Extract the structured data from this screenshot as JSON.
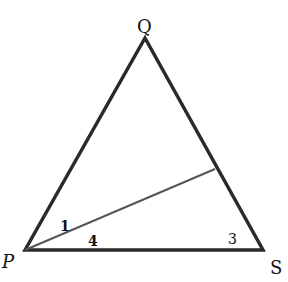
{
  "diagram": {
    "type": "geometry-triangle",
    "vertices": {
      "P": {
        "label": "P",
        "x": 25,
        "y": 250
      },
      "Q": {
        "label": "Q",
        "x": 145,
        "y": 38
      },
      "S": {
        "label": "S",
        "x": 263,
        "y": 250
      }
    },
    "cevian": {
      "from": "P",
      "to_point_on": "QS",
      "end_x": 215,
      "end_y": 169
    },
    "angle_labels": [
      {
        "text": "1",
        "x": 60,
        "y": 231
      },
      {
        "text": "4",
        "x": 92,
        "y": 246
      },
      {
        "text": "3",
        "x": 230,
        "y": 244
      }
    ],
    "vertex_labels": {
      "P": "P",
      "Q": "Q",
      "S": "S"
    },
    "colors": {
      "stroke": "#2a2a2a",
      "cevian": "#555555",
      "text": "#111111"
    }
  }
}
